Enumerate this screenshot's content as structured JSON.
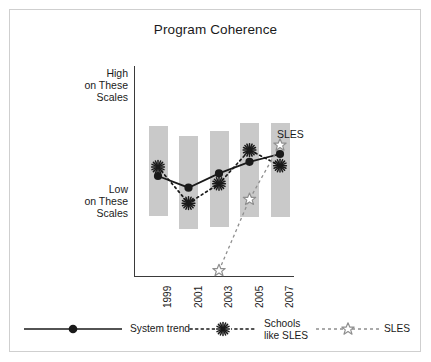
{
  "chart_data": {
    "type": "line",
    "title": "Program Coherence",
    "xlabel": "",
    "ylabel": "",
    "categories": [
      "1999",
      "2001",
      "2003",
      "2005",
      "2007"
    ],
    "axis": {
      "y_high_label": "High\non These\nScales",
      "y_low_label": "Low\non These\nScales",
      "y_high_value": 100,
      "y_low_value": 0,
      "ylim": [
        -45,
        118
      ],
      "grid": false
    },
    "background_bars": {
      "name": "range bars",
      "color": "#c9c9c9",
      "tops": [
        72,
        64,
        68,
        74,
        74
      ],
      "bottoms": [
        2,
        -8,
        -6,
        1,
        1
      ]
    },
    "series": [
      {
        "name": "System trend",
        "marker": "filled-circle",
        "line": "solid",
        "color": "#1a1a1a",
        "x": [
          "1999",
          "2001",
          "2003",
          "2005",
          "2007"
        ],
        "values": [
          33,
          24,
          35,
          44,
          50
        ]
      },
      {
        "name": "Schools like SLES",
        "marker": "asterisk",
        "line": "dotted",
        "color": "#1a1a1a",
        "x": [
          "1999",
          "2001",
          "2003",
          "2005",
          "2007"
        ],
        "values": [
          40,
          12,
          27,
          53,
          41
        ]
      },
      {
        "name": "SLES",
        "marker": "open-star",
        "line": "dashed",
        "color": "#8f8f8f",
        "x": [
          "2003",
          "2005",
          "2007"
        ],
        "values": [
          -40,
          15,
          57
        ]
      }
    ],
    "annotations": [
      {
        "text": "SLES",
        "x": "2007",
        "y": 57,
        "placement": "right"
      }
    ],
    "legend": {
      "position": "bottom",
      "entries": [
        {
          "label": "System trend",
          "marker": "filled-circle",
          "line": "solid",
          "color": "#1a1a1a"
        },
        {
          "label": "Schools\nlike SLES",
          "marker": "asterisk",
          "line": "dotted",
          "color": "#1a1a1a"
        },
        {
          "label": "SLES",
          "marker": "open-star",
          "line": "dashed",
          "color": "#8f8f8f"
        }
      ]
    }
  },
  "colors": {
    "bar": "#c9c9c9",
    "axis": "#3a3a3a",
    "dark_series": "#1a1a1a",
    "light_series": "#8f8f8f",
    "frame": "#cfcfcf",
    "background": "#ffffff"
  }
}
